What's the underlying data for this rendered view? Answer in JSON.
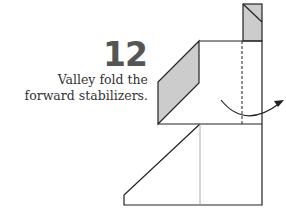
{
  "step": {
    "number": "12",
    "instruction_line1": "Valley fold the",
    "instruction_line2": "forward stabilizers."
  },
  "colors": {
    "line": "#222222",
    "fill_shaded": "#cccccc",
    "guide": "#aaaaaa",
    "number": "#555555"
  }
}
